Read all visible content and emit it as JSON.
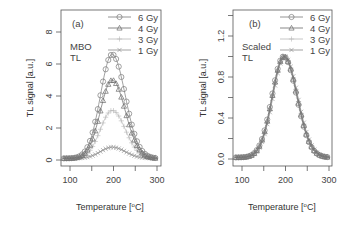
{
  "chart_data": [
    {
      "type": "line",
      "panel_label": "(a)",
      "annotation": [
        "MBO",
        "TL"
      ],
      "xlabel": "Temperature [°C]",
      "ylabel": "TL signal [a.u.]",
      "xlim": [
        80,
        305
      ],
      "ylim": [
        -0.4,
        9.4
      ],
      "xticks": [
        100,
        150,
        200,
        250,
        300
      ],
      "xtick_labels": [
        "100",
        "200",
        "300"
      ],
      "yticks": [
        0,
        2,
        4,
        6,
        8
      ],
      "ytick_labels": [
        "0",
        "2",
        "4",
        "6",
        "8"
      ],
      "grid": false,
      "legend_position": "top-right",
      "peak_temperature": 197,
      "series": [
        {
          "name": "6 Gy",
          "marker": "circle",
          "peak": 6.6,
          "color": "#7a7a7a"
        },
        {
          "name": "4 Gy",
          "marker": "triangle",
          "peak": 5.0,
          "color": "#6a6a6a"
        },
        {
          "name": "3 Gy",
          "marker": "plus",
          "peak": 3.1,
          "color": "#b8b8b8"
        },
        {
          "name": "1 Gy",
          "marker": "cross",
          "peak": 0.8,
          "color": "#8a8a8a"
        }
      ],
      "baseline": 0.1
    },
    {
      "type": "line",
      "panel_label": "(b)",
      "annotation": [
        "Scaled",
        "TL"
      ],
      "xlabel": "Temperature [°C]",
      "ylabel": "TL signal [a.u.]",
      "xlim": [
        80,
        305
      ],
      "ylim": [
        -0.05,
        1.45
      ],
      "xticks": [
        100,
        150,
        200,
        250,
        300
      ],
      "xtick_labels": [
        "100",
        "200",
        "300"
      ],
      "yticks": [
        0.0,
        0.2,
        0.4,
        0.6,
        0.8,
        1.0,
        1.2,
        1.4
      ],
      "ytick_labels": [
        "0.0",
        "0.4",
        "0.8",
        "1.2"
      ],
      "grid": false,
      "legend_position": "top-right",
      "peak_temperature": 197,
      "series": [
        {
          "name": "6 Gy",
          "marker": "circle",
          "peak": 1.0,
          "color": "#7a7a7a"
        },
        {
          "name": "4 Gy",
          "marker": "triangle",
          "peak": 1.0,
          "color": "#6a6a6a"
        },
        {
          "name": "3 Gy",
          "marker": "plus",
          "peak": 1.0,
          "color": "#b8b8b8"
        },
        {
          "name": "1 Gy",
          "marker": "cross",
          "peak": 1.0,
          "color": "#8a8a8a"
        }
      ],
      "baseline": 0.015
    }
  ],
  "panels": {
    "a": {
      "label": "(a)",
      "note1": "MBO",
      "note2": "TL",
      "xlabel": "Temperature [",
      "xlabel_unit": "C]",
      "ylabel": "TL signal [a.u.]"
    },
    "b": {
      "label": "(b)",
      "note1": "Scaled",
      "note2": "TL",
      "xlabel": "Temperature [",
      "xlabel_unit": "C]",
      "ylabel": "TL signal [a.u.]"
    }
  },
  "legend": [
    "6 Gy",
    "4 Gy",
    "3 Gy",
    "1 Gy"
  ]
}
